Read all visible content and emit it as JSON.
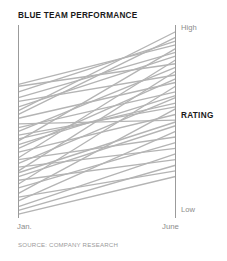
{
  "header": {
    "title": "BLUE TEAM PERFORMANCE"
  },
  "footer": {
    "source": "SOURCE: COMPANY RESEARCH"
  },
  "axes": {
    "value_axis_title": "RATING",
    "value_high_label": "High",
    "value_low_label": "Low",
    "category_left_label": "Jan.",
    "category_right_label": "June"
  },
  "colors": {
    "line": "#b4b4b4",
    "axis": "#9b9b9b",
    "title_text": "#1a1a1a",
    "muted_text": "#8c8c8c",
    "source_text": "#9a9a9a",
    "background": "#ffffff"
  },
  "chart_data": {
    "type": "line",
    "subtype": "slopegraph",
    "title": "BLUE TEAM PERFORMANCE",
    "xlabel": "",
    "ylabel": "RATING",
    "categories": [
      "Jan.",
      "June"
    ],
    "x": [
      0,
      1
    ],
    "ylim": [
      0,
      100
    ],
    "ylim_labels": [
      "Low",
      "High"
    ],
    "grid": false,
    "legend": false,
    "axis_ticks_numeric": false,
    "note": "Each line is one team member's rating moving from January to June; all lines slope upward.",
    "series": [
      {
        "name": "member-01",
        "values": [
          56,
          98
        ]
      },
      {
        "name": "member-02",
        "values": [
          54,
          95
        ]
      },
      {
        "name": "member-03",
        "values": [
          66,
          93
        ]
      },
      {
        "name": "member-04",
        "values": [
          70,
          91
        ]
      },
      {
        "name": "member-05",
        "values": [
          40,
          89
        ]
      },
      {
        "name": "member-06",
        "values": [
          63,
          87
        ]
      },
      {
        "name": "member-07",
        "values": [
          58,
          85
        ]
      },
      {
        "name": "member-08",
        "values": [
          31,
          83
        ]
      },
      {
        "name": "member-09",
        "values": [
          69,
          81
        ]
      },
      {
        "name": "member-10",
        "values": [
          45,
          79
        ]
      },
      {
        "name": "member-11",
        "values": [
          24,
          77
        ]
      },
      {
        "name": "member-12",
        "values": [
          61,
          75
        ]
      },
      {
        "name": "member-13",
        "values": [
          36,
          73
        ]
      },
      {
        "name": "member-14",
        "values": [
          52,
          71
        ]
      },
      {
        "name": "member-15",
        "values": [
          17,
          69
        ]
      },
      {
        "name": "member-16",
        "values": [
          47,
          66
        ]
      },
      {
        "name": "member-17",
        "values": [
          28,
          63
        ]
      },
      {
        "name": "member-18",
        "values": [
          41,
          60
        ]
      },
      {
        "name": "member-19",
        "values": [
          12,
          57
        ]
      },
      {
        "name": "member-20",
        "values": [
          34,
          54
        ]
      },
      {
        "name": "member-21",
        "values": [
          49,
          51
        ]
      },
      {
        "name": "member-22",
        "values": [
          21,
          48
        ]
      },
      {
        "name": "member-23",
        "values": [
          8,
          45
        ]
      },
      {
        "name": "member-24",
        "values": [
          30,
          42
        ]
      },
      {
        "name": "member-25",
        "values": [
          15,
          39
        ]
      },
      {
        "name": "member-26",
        "values": [
          26,
          36
        ]
      },
      {
        "name": "member-27",
        "values": [
          5,
          33
        ]
      },
      {
        "name": "member-28",
        "values": [
          19,
          30
        ]
      },
      {
        "name": "member-29",
        "values": [
          3,
          27
        ]
      },
      {
        "name": "member-30",
        "values": [
          10,
          24
        ]
      },
      {
        "name": "member-31",
        "values": [
          1,
          21
        ]
      },
      {
        "name": "member-32",
        "values": [
          38,
          64
        ]
      },
      {
        "name": "member-33",
        "values": [
          43,
          58
        ]
      },
      {
        "name": "member-34",
        "values": [
          23,
          50
        ]
      }
    ]
  },
  "geometry": {
    "left_axis_x": 18.5,
    "right_axis_x": 175.5,
    "axis_top_y": 25,
    "axis_bottom_y": 218,
    "line_top_y": 28,
    "line_bottom_y": 216
  }
}
